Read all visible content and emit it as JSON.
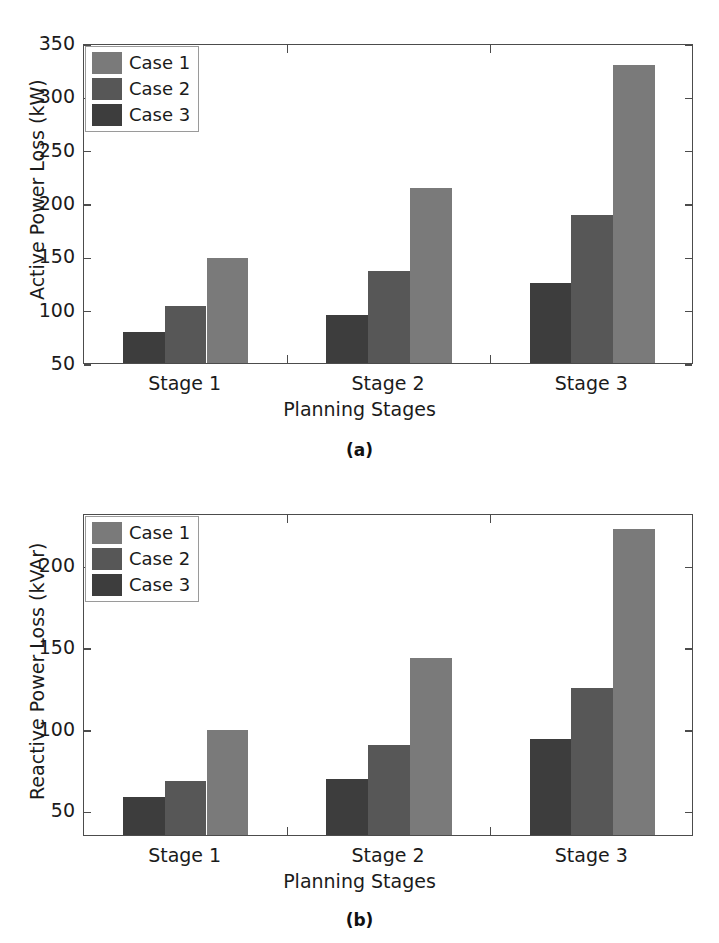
{
  "figure": {
    "panels": [
      {
        "caption": "(a)",
        "caption_letter": "a",
        "legend": [
          "Case 1",
          "Case 2",
          "Case 3"
        ],
        "chart_key": 0
      },
      {
        "caption": "(b)",
        "caption_letter": "b",
        "legend": [
          "Case 1",
          "Case 2",
          "Case 3"
        ],
        "chart_key": 1
      }
    ],
    "colors": {
      "case1": "#7a7a7a",
      "case2": "#575757",
      "case3": "#3d3d3d",
      "axis": "#4c4c4c",
      "text": "#1b1b1b",
      "background": "#ffffff"
    }
  },
  "chart_data": [
    {
      "type": "bar",
      "title": "",
      "subtitle": "(a)",
      "xlabel": "Planning Stages",
      "ylabel": "Active Power Loss (kW)",
      "categories": [
        "Stage 1",
        "Stage 2",
        "Stage 3"
      ],
      "series": [
        {
          "name": "Case 1",
          "values": [
            148,
            214,
            329
          ],
          "color": "#7a7a7a"
        },
        {
          "name": "Case 2",
          "values": [
            103,
            136,
            189
          ],
          "color": "#575757"
        },
        {
          "name": "Case 3",
          "values": [
            79,
            95,
            125
          ],
          "color": "#3d3d3d"
        }
      ],
      "bar_order": [
        "Case 3",
        "Case 2",
        "Case 1"
      ],
      "ylim": [
        50,
        350
      ],
      "yticks": [
        50,
        100,
        150,
        200,
        250,
        300,
        350
      ],
      "grid": false,
      "legend_position": "top-left",
      "units": "kW"
    },
    {
      "type": "bar",
      "title": "",
      "subtitle": "(b)",
      "xlabel": "Planning Stages",
      "ylabel": "Reactive Power Loss (kVAr)",
      "categories": [
        "Stage 1",
        "Stage 2",
        "Stage 3"
      ],
      "series": [
        {
          "name": "Case 1",
          "values": [
            99,
            143,
            222
          ],
          "color": "#7a7a7a"
        },
        {
          "name": "Case 2",
          "values": [
            68,
            90,
            125
          ],
          "color": "#575757"
        },
        {
          "name": "Case 3",
          "values": [
            58,
            69,
            94
          ],
          "color": "#3d3d3d"
        }
      ],
      "bar_order": [
        "Case 3",
        "Case 2",
        "Case 1"
      ],
      "ylim": [
        35,
        232
      ],
      "yticks": [
        50,
        100,
        150,
        200
      ],
      "grid": false,
      "legend_position": "top-left",
      "units": "kVAr"
    }
  ]
}
